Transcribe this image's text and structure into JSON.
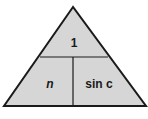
{
  "diagram": {
    "type": "formula-triangle",
    "colors": {
      "fill": "#d6d6d6",
      "stroke": "#1a1a1a",
      "text": "#1a1a1a"
    },
    "top": {
      "label": "1"
    },
    "bottom_left": {
      "label": "n"
    },
    "bottom_right": {
      "label": "sin c"
    }
  }
}
